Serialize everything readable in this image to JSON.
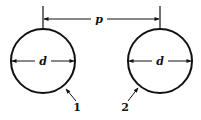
{
  "diagram": {
    "type": "geometry-dimension-drawing",
    "colors": {
      "stroke": "#111111",
      "background": "#ffffff"
    },
    "pitch_dimension": {
      "label": "p"
    },
    "circles": [
      {
        "id": "1",
        "number_label": "1",
        "diameter_label": "d"
      },
      {
        "id": "2",
        "number_label": "2",
        "diameter_label": "d"
      }
    ]
  }
}
